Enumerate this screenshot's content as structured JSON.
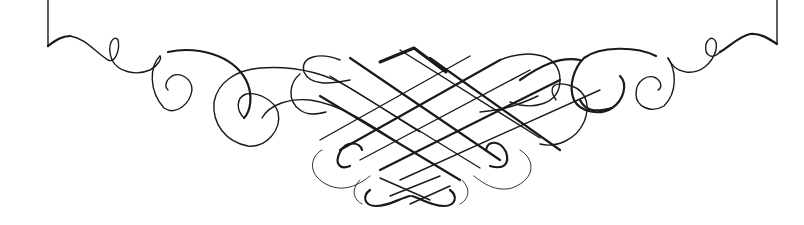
{
  "ornament": {
    "description": "Calligraphic flourish ornament beneath a bracket frame",
    "ink_color": "#1a1a1a",
    "background_color": "#ffffff",
    "components": [
      "left-bracket-edge",
      "right-bracket-edge",
      "left-scroll-flourish",
      "right-scroll-flourish",
      "center-lattice-knot",
      "bottom-small-knot"
    ]
  }
}
